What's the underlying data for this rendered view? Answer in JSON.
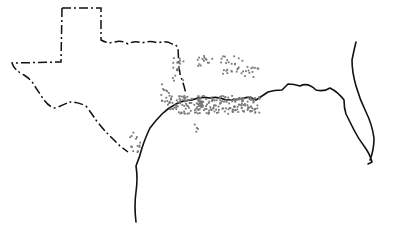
{
  "map": {
    "region": "U.S. Gulf Coast: Texas, Louisiana, Mississippi, Alabama, Florida",
    "features": [
      "coastline",
      "Texas state border (dash-dot)",
      "Florida peninsula"
    ],
    "colors": {
      "outline": "#111111",
      "occurrence_dots": "#777777",
      "background": "#ffffff"
    },
    "markers": {
      "type": "occurrence dots",
      "clusters": [
        {
          "name": "east-texas-north",
          "cx": 177,
          "cy": 68,
          "count": 18,
          "spread": [
            6,
            12
          ]
        },
        {
          "name": "ark-la-north-1",
          "cx": 204,
          "cy": 60,
          "count": 14,
          "spread": [
            8,
            6
          ]
        },
        {
          "name": "ark-la-north-2",
          "cx": 232,
          "cy": 64,
          "count": 26,
          "spread": [
            12,
            9
          ]
        },
        {
          "name": "la-north-east",
          "cx": 252,
          "cy": 72,
          "count": 12,
          "spread": [
            8,
            6
          ]
        },
        {
          "name": "east-texas-west",
          "cx": 166,
          "cy": 92,
          "count": 14,
          "spread": [
            6,
            10
          ]
        },
        {
          "name": "gulf-band-west",
          "cx": 185,
          "cy": 104,
          "count": 80,
          "spread": [
            18,
            9
          ]
        },
        {
          "name": "gulf-band-center",
          "cx": 215,
          "cy": 104,
          "count": 90,
          "spread": [
            18,
            9
          ]
        },
        {
          "name": "gulf-band-east",
          "cx": 245,
          "cy": 104,
          "count": 70,
          "spread": [
            14,
            8
          ]
        },
        {
          "name": "south-texas",
          "cx": 135,
          "cy": 140,
          "count": 14,
          "spread": [
            6,
            12
          ]
        },
        {
          "name": "stray",
          "cx": 190,
          "cy": 128,
          "count": 4,
          "spread": [
            10,
            6
          ]
        }
      ]
    }
  }
}
